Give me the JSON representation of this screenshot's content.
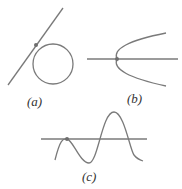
{
  "figure": {
    "panels": [
      {
        "id": "a",
        "label": "(a)",
        "description": "line tangent to circle at a point"
      },
      {
        "id": "b",
        "label": "(b)",
        "description": "horizontal line through vertex of sideways parabola"
      },
      {
        "id": "c",
        "label": "(c)",
        "description": "horizontal line tangent to wave curve at local max"
      }
    ],
    "colors": {
      "stroke": "#7a7a7a",
      "point": "#6e6e6e",
      "text": "#333333"
    }
  }
}
